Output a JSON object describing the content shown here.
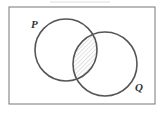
{
  "diagram": {
    "type": "venn",
    "sets": [
      {
        "label": "P",
        "cx": 66,
        "cy": 50,
        "r": 31
      },
      {
        "label": "Q",
        "cx": 105,
        "cy": 64,
        "r": 32
      }
    ],
    "shaded_region": "P ∩ Q",
    "colors": {
      "stroke": "#555555",
      "hatch": "#bbbbbb",
      "frame": "#777777"
    }
  },
  "labels": {
    "p": "P",
    "q": "Q"
  }
}
